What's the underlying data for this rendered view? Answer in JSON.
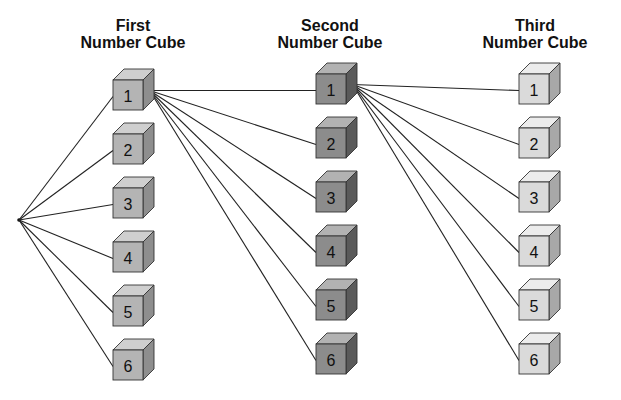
{
  "diagram": {
    "type": "tree",
    "columns": [
      {
        "title_line1": "First",
        "title_line2": "Number Cube",
        "labels": [
          "1",
          "2",
          "3",
          "4",
          "5",
          "6"
        ],
        "front_color": "#b4b4b4",
        "top_color": "#cfcfcf",
        "side_color": "#8e8e8e"
      },
      {
        "title_line1": "Second",
        "title_line2": "Number Cube",
        "labels": [
          "1",
          "2",
          "3",
          "4",
          "5",
          "6"
        ],
        "front_color": "#8c8c8c",
        "top_color": "#b2b2b2",
        "side_color": "#5a5a5a"
      },
      {
        "title_line1": "Third",
        "title_line2": "Number Cube",
        "labels": [
          "1",
          "2",
          "3",
          "4",
          "5",
          "6"
        ],
        "front_color": "#dadada",
        "top_color": "#ececec",
        "side_color": "#a8a8a8"
      }
    ],
    "edges": [
      "root -> First 1..6",
      "First 1 -> Second 1..6",
      "Second 1 -> Third 1..6"
    ]
  }
}
